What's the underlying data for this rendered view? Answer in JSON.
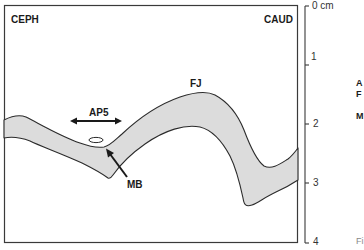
{
  "diagram": {
    "labels": {
      "ceph": "CEPH",
      "caud": "CAUD",
      "fj": "FJ",
      "ap5": "AP5",
      "mb": "MB"
    },
    "scale": {
      "unit": "cm",
      "ticks": [
        "0 cm",
        "1",
        "2",
        "3",
        "4"
      ]
    },
    "cropped_legend": {
      "line1": "A",
      "line2": "F",
      "line3": "M",
      "fig": "Fi"
    },
    "colors": {
      "band_fill": "#dcdcdc",
      "stroke": "#2b2b2b",
      "frame": "#3a3a3a"
    }
  }
}
